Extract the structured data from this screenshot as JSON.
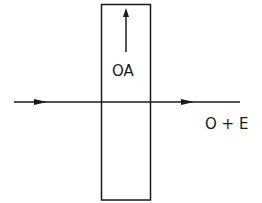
{
  "diagram": {
    "title": "",
    "crystal_plate": {
      "x": 101,
      "y": 4,
      "width": 49,
      "height": 196
    },
    "optic_axis": {
      "label": "OA",
      "direction": "up"
    },
    "beam": {
      "incident_arrow": "right",
      "output_label": "O + E"
    },
    "colors": {
      "stroke": "#1a1a1a",
      "background": "#ffffff"
    }
  }
}
